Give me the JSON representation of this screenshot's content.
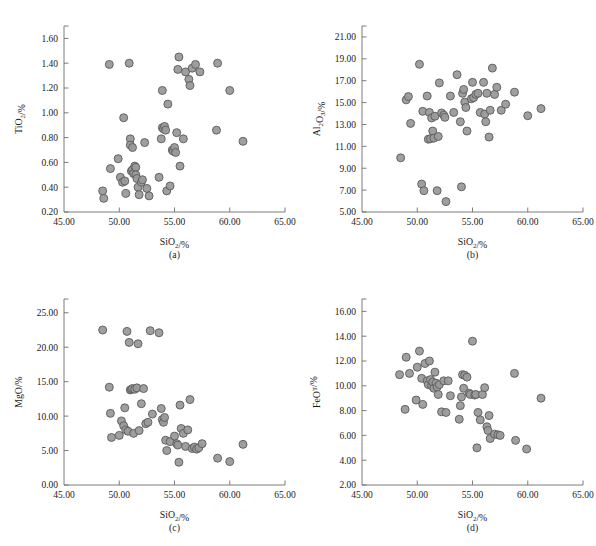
{
  "figure": {
    "background": "#ffffff",
    "marker_fill": "#9a9a9a",
    "marker_stroke": "#5a5a5a"
  },
  "chart_data": [
    {
      "type": "scatter",
      "panel": "a",
      "caption": "(a)",
      "title": "",
      "xlabel": "SiO2/%",
      "ylabel": "TiO2/%",
      "xlim": [
        45.0,
        65.0
      ],
      "ylim": [
        0.2,
        1.7
      ],
      "xticks": [
        "45.00",
        "50.00",
        "55.00",
        "60.00",
        "65.00"
      ],
      "xtick_values": [
        45.0,
        50.0,
        55.0,
        60.0,
        65.0
      ],
      "yticks": [
        "0.20",
        "0.40",
        "0.60",
        "0.80",
        "1.00",
        "1.20",
        "1.40",
        "1.60"
      ],
      "ytick_values": [
        0.2,
        0.4,
        0.6,
        0.8,
        1.0,
        1.2,
        1.4,
        1.6
      ],
      "grid": false,
      "legend": "none",
      "points": [
        [
          48.5,
          0.37
        ],
        [
          48.6,
          0.31
        ],
        [
          49.1,
          1.39
        ],
        [
          49.2,
          0.55
        ],
        [
          49.9,
          0.63
        ],
        [
          50.1,
          0.48
        ],
        [
          50.3,
          0.44
        ],
        [
          50.4,
          0.96
        ],
        [
          50.5,
          0.45
        ],
        [
          50.6,
          0.35
        ],
        [
          50.9,
          1.4
        ],
        [
          51.0,
          0.79
        ],
        [
          51.0,
          0.74
        ],
        [
          51.1,
          0.53
        ],
        [
          51.2,
          0.72
        ],
        [
          51.2,
          0.54
        ],
        [
          51.3,
          0.51
        ],
        [
          51.4,
          0.57
        ],
        [
          51.5,
          0.56
        ],
        [
          51.5,
          0.5
        ],
        [
          51.6,
          0.47
        ],
        [
          51.7,
          0.4
        ],
        [
          51.8,
          0.34
        ],
        [
          52.0,
          0.44
        ],
        [
          52.1,
          0.46
        ],
        [
          52.3,
          0.76
        ],
        [
          52.5,
          0.39
        ],
        [
          52.7,
          0.33
        ],
        [
          53.6,
          0.48
        ],
        [
          53.8,
          0.79
        ],
        [
          53.9,
          0.88
        ],
        [
          53.9,
          1.18
        ],
        [
          54.0,
          0.87
        ],
        [
          54.1,
          0.89
        ],
        [
          54.2,
          0.86
        ],
        [
          54.3,
          0.37
        ],
        [
          54.4,
          1.07
        ],
        [
          54.6,
          0.41
        ],
        [
          54.8,
          0.7
        ],
        [
          54.9,
          0.69
        ],
        [
          55.0,
          0.72
        ],
        [
          55.1,
          0.68
        ],
        [
          55.2,
          0.84
        ],
        [
          55.3,
          1.35
        ],
        [
          55.4,
          1.45
        ],
        [
          55.5,
          0.57
        ],
        [
          55.8,
          0.79
        ],
        [
          56.0,
          1.33
        ],
        [
          56.3,
          1.27
        ],
        [
          56.4,
          1.22
        ],
        [
          56.6,
          1.36
        ],
        [
          56.9,
          1.39
        ],
        [
          57.3,
          1.33
        ],
        [
          58.9,
          1.4
        ],
        [
          58.8,
          0.86
        ],
        [
          60.0,
          1.18
        ],
        [
          61.2,
          0.77
        ]
      ]
    },
    {
      "type": "scatter",
      "panel": "b",
      "caption": "(b)",
      "title": "",
      "xlabel": "SiO2/%",
      "ylabel": "Al2O3/%",
      "xlim": [
        45.0,
        65.0
      ],
      "ylim": [
        5.0,
        22.0
      ],
      "xticks": [
        "45.00",
        "50.00",
        "55.00",
        "60.00",
        "65.00"
      ],
      "xtick_values": [
        45.0,
        50.0,
        55.0,
        60.0,
        65.0
      ],
      "yticks": [
        "5.00",
        "7.00",
        "9.00",
        "11.00",
        "13.00",
        "15.00",
        "17.00",
        "19.00",
        "21.00"
      ],
      "ytick_values": [
        5.0,
        7.0,
        9.0,
        11.0,
        13.0,
        15.0,
        17.0,
        19.0,
        21.0
      ],
      "grid": false,
      "legend": "none",
      "points": [
        [
          48.5,
          9.95
        ],
        [
          49.0,
          15.25
        ],
        [
          49.2,
          15.55
        ],
        [
          49.4,
          13.1
        ],
        [
          50.2,
          18.5
        ],
        [
          50.4,
          7.55
        ],
        [
          50.5,
          14.2
        ],
        [
          50.6,
          6.95
        ],
        [
          50.9,
          15.6
        ],
        [
          51.0,
          11.65
        ],
        [
          51.1,
          14.1
        ],
        [
          51.2,
          11.7
        ],
        [
          51.3,
          13.6
        ],
        [
          51.4,
          12.4
        ],
        [
          51.5,
          11.75
        ],
        [
          51.6,
          13.75
        ],
        [
          51.8,
          6.95
        ],
        [
          51.9,
          11.9
        ],
        [
          52.0,
          16.8
        ],
        [
          52.2,
          14.05
        ],
        [
          52.4,
          13.85
        ],
        [
          52.5,
          13.65
        ],
        [
          52.6,
          5.95
        ],
        [
          53.0,
          15.6
        ],
        [
          53.3,
          14.1
        ],
        [
          53.6,
          17.55
        ],
        [
          53.9,
          13.25
        ],
        [
          54.0,
          7.3
        ],
        [
          54.1,
          15.85
        ],
        [
          54.2,
          16.2
        ],
        [
          54.3,
          15.05
        ],
        [
          54.4,
          14.55
        ],
        [
          54.5,
          12.4
        ],
        [
          54.9,
          15.35
        ],
        [
          55.0,
          16.85
        ],
        [
          55.1,
          15.45
        ],
        [
          55.3,
          15.75
        ],
        [
          55.5,
          15.85
        ],
        [
          55.7,
          14.1
        ],
        [
          56.0,
          16.85
        ],
        [
          56.1,
          13.95
        ],
        [
          56.2,
          13.25
        ],
        [
          56.3,
          15.85
        ],
        [
          56.5,
          11.85
        ],
        [
          56.6,
          14.3
        ],
        [
          56.8,
          18.15
        ],
        [
          57.0,
          15.75
        ],
        [
          57.2,
          16.4
        ],
        [
          57.6,
          14.3
        ],
        [
          58.0,
          14.85
        ],
        [
          58.8,
          15.95
        ],
        [
          60.0,
          13.8
        ],
        [
          61.2,
          14.45
        ]
      ]
    },
    {
      "type": "scatter",
      "panel": "c",
      "caption": "(c)",
      "title": "",
      "xlabel": "SiO2/%",
      "ylabel": "MgO/%",
      "xlim": [
        45.0,
        65.0
      ],
      "ylim": [
        0.0,
        27.0
      ],
      "xticks": [
        "45.00",
        "50.00",
        "55.00",
        "60.00",
        "65.00"
      ],
      "xtick_values": [
        45.0,
        50.0,
        55.0,
        60.0,
        65.0
      ],
      "yticks": [
        "0.00",
        "5.00",
        "10.00",
        "15.00",
        "20.00",
        "25.00"
      ],
      "ytick_values": [
        0.0,
        5.0,
        10.0,
        15.0,
        20.0,
        25.0
      ],
      "grid": false,
      "legend": "none",
      "points": [
        [
          48.5,
          22.5
        ],
        [
          49.1,
          14.2
        ],
        [
          49.2,
          10.4
        ],
        [
          49.3,
          6.9
        ],
        [
          50.0,
          7.2
        ],
        [
          50.2,
          9.3
        ],
        [
          50.4,
          8.6
        ],
        [
          50.5,
          11.2
        ],
        [
          50.6,
          8.0
        ],
        [
          50.7,
          22.3
        ],
        [
          50.8,
          7.8
        ],
        [
          50.9,
          20.7
        ],
        [
          51.0,
          13.8
        ],
        [
          51.1,
          13.9
        ],
        [
          51.2,
          14.0
        ],
        [
          51.3,
          7.5
        ],
        [
          51.4,
          13.9
        ],
        [
          51.6,
          14.1
        ],
        [
          51.7,
          20.5
        ],
        [
          51.8,
          7.9
        ],
        [
          52.0,
          11.8
        ],
        [
          52.2,
          14.0
        ],
        [
          52.4,
          8.9
        ],
        [
          52.6,
          9.1
        ],
        [
          52.8,
          22.4
        ],
        [
          53.0,
          10.3
        ],
        [
          53.6,
          22.1
        ],
        [
          53.8,
          11.1
        ],
        [
          53.9,
          9.5
        ],
        [
          54.0,
          9.1
        ],
        [
          54.1,
          9.8
        ],
        [
          54.2,
          6.5
        ],
        [
          54.3,
          5.0
        ],
        [
          54.6,
          6.3
        ],
        [
          55.0,
          7.1
        ],
        [
          55.2,
          6.0
        ],
        [
          55.3,
          5.8
        ],
        [
          55.4,
          3.3
        ],
        [
          55.5,
          11.6
        ],
        [
          55.6,
          8.2
        ],
        [
          55.8,
          7.5
        ],
        [
          56.0,
          5.6
        ],
        [
          56.2,
          8.0
        ],
        [
          56.4,
          12.4
        ],
        [
          56.6,
          5.3
        ],
        [
          56.8,
          5.5
        ],
        [
          57.0,
          5.2
        ],
        [
          57.2,
          5.4
        ],
        [
          57.5,
          6.0
        ],
        [
          58.9,
          3.9
        ],
        [
          60.0,
          3.4
        ],
        [
          61.2,
          5.9
        ]
      ]
    },
    {
      "type": "scatter",
      "panel": "d",
      "caption": "(d)",
      "title": "",
      "xlabel": "SiO2/%",
      "ylabel": "FeOT/%",
      "xlim": [
        45.0,
        65.0
      ],
      "ylim": [
        2.0,
        17.0
      ],
      "xticks": [
        "45.00",
        "50.00",
        "55.00",
        "60.00",
        "65.00"
      ],
      "xtick_values": [
        45.0,
        50.0,
        55.0,
        60.0,
        65.0
      ],
      "yticks": [
        "2.00",
        "4.00",
        "6.00",
        "8.00",
        "10.00",
        "12.00",
        "14.00",
        "16.00"
      ],
      "ytick_values": [
        2.0,
        4.0,
        6.0,
        8.0,
        10.0,
        12.0,
        14.0,
        16.0
      ],
      "grid": false,
      "legend": "none",
      "points": [
        [
          48.4,
          10.9
        ],
        [
          48.9,
          8.1
        ],
        [
          49.0,
          12.3
        ],
        [
          49.3,
          11.0
        ],
        [
          49.9,
          8.85
        ],
        [
          50.0,
          11.5
        ],
        [
          50.2,
          12.8
        ],
        [
          50.4,
          10.6
        ],
        [
          50.5,
          8.5
        ],
        [
          50.7,
          11.8
        ],
        [
          50.9,
          10.4
        ],
        [
          51.0,
          10.1
        ],
        [
          51.1,
          12.0
        ],
        [
          51.2,
          10.5
        ],
        [
          51.3,
          10.0
        ],
        [
          51.4,
          10.3
        ],
        [
          51.5,
          9.8
        ],
        [
          51.6,
          11.1
        ],
        [
          51.7,
          10.2
        ],
        [
          51.8,
          9.9
        ],
        [
          51.9,
          9.3
        ],
        [
          52.0,
          10.1
        ],
        [
          52.2,
          7.9
        ],
        [
          52.4,
          10.4
        ],
        [
          52.6,
          7.85
        ],
        [
          52.8,
          10.4
        ],
        [
          53.0,
          9.2
        ],
        [
          53.8,
          7.3
        ],
        [
          53.9,
          8.4
        ],
        [
          54.0,
          9.1
        ],
        [
          54.1,
          10.9
        ],
        [
          54.2,
          9.8
        ],
        [
          54.3,
          10.85
        ],
        [
          54.5,
          10.7
        ],
        [
          54.7,
          9.4
        ],
        [
          54.8,
          9.3
        ],
        [
          55.0,
          13.6
        ],
        [
          55.2,
          9.25
        ],
        [
          55.3,
          9.3
        ],
        [
          55.4,
          5.0
        ],
        [
          55.5,
          7.85
        ],
        [
          55.7,
          7.25
        ],
        [
          55.9,
          9.3
        ],
        [
          56.1,
          9.85
        ],
        [
          56.3,
          6.7
        ],
        [
          56.4,
          6.4
        ],
        [
          56.5,
          7.6
        ],
        [
          56.6,
          5.75
        ],
        [
          57.0,
          6.1
        ],
        [
          57.3,
          6.05
        ],
        [
          57.5,
          6.0
        ],
        [
          58.8,
          11.0
        ],
        [
          58.9,
          5.6
        ],
        [
          59.9,
          4.9
        ],
        [
          61.2,
          9.0
        ]
      ]
    }
  ]
}
